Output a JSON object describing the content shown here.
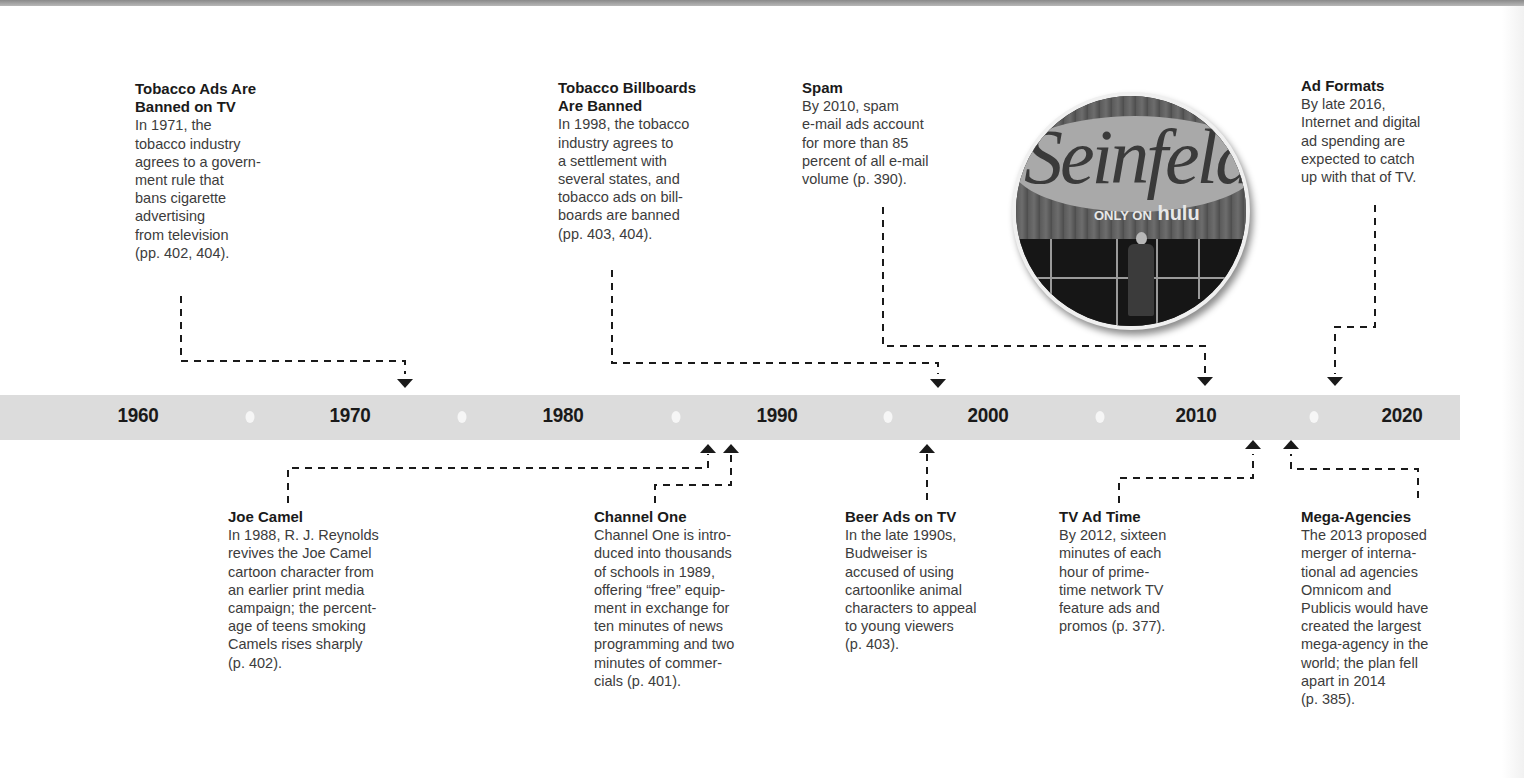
{
  "timeline": {
    "years": [
      {
        "label": "1960",
        "x": 138
      },
      {
        "label": "1970",
        "x": 350
      },
      {
        "label": "1980",
        "x": 563
      },
      {
        "label": "1990",
        "x": 777
      },
      {
        "label": "2000",
        "x": 988
      },
      {
        "label": "2010",
        "x": 1196
      },
      {
        "label": "2020",
        "x": 1402
      }
    ],
    "dots_x": [
      250,
      462,
      676,
      888,
      1100,
      1314
    ],
    "bar_color": "#dcdcdc"
  },
  "events_above": [
    {
      "title": "Tobacco Ads Are\nBanned on TV",
      "body": "In 1971, the\ntobacco industry\nagrees to a govern-\nment rule that\nbans cigarette\nadvertising\nfrom television\n(pp. 402, 404).",
      "year": "1971"
    },
    {
      "title": "Tobacco Billboards\nAre Banned",
      "body": "In 1998, the tobacco\nindustry agrees to\na settlement with\nseveral states, and\ntobacco ads on bill-\nboards are banned\n(pp. 403, 404).",
      "year": "1998"
    },
    {
      "title": "Spam",
      "body": "By 2010, spam\ne-mail ads account\nfor more than 85\npercent of all e-mail\nvolume (p. 390).",
      "year": "2010"
    },
    {
      "title": "Ad Formats",
      "body": "By late 2016,\nInternet and digital\nad spending are\nexpected to catch\nup with that of TV.",
      "year": "2016"
    }
  ],
  "events_below": [
    {
      "title": "Joe Camel",
      "body": "In 1988, R. J. Reynolds\nrevives the Joe Camel\ncartoon character from\nan earlier print media\ncampaign; the percent-\nage of teens smoking\nCamels rises sharply\n(p. 402).",
      "year": "1988"
    },
    {
      "title": "Channel One",
      "body": "Channel One is intro-\nduced into thousands\nof schools in 1989,\noffering “free” equip-\nment in exchange for\nten minutes of news\nprogramming and two\nminutes of commer-\ncials (p. 401).",
      "year": "1989"
    },
    {
      "title": "Beer Ads on TV",
      "body": "In the late 1990s,\nBudweiser is\naccused of using\ncartoonlike animal\ncharacters to appeal\nto young viewers\n(p. 403).",
      "year": "late 1990s"
    },
    {
      "title": "TV Ad Time",
      "body": "By 2012, sixteen\nminutes of each\nhour of prime-\ntime network TV\nfeature ads and\npromos (p. 377).",
      "year": "2012"
    },
    {
      "title": "Mega-Agencies",
      "body": "The 2013 proposed\nmerger of interna-\ntional ad agencies\nOmnicom and\nPublicis would have\ncreated the largest\nmega-agency in the\nworld; the plan fell\napart in 2014\n(p. 385).",
      "year": "2013"
    }
  ],
  "photo": {
    "logo_text": "Seinfeld",
    "tag_prefix": "ONLY ON",
    "tag_brand": "hulu"
  }
}
